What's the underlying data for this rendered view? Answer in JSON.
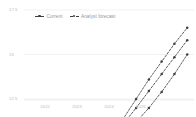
{
  "chart_data": {
    "type": "line",
    "title": "",
    "subtitle": "",
    "xlabel": "",
    "ylabel": "",
    "xlim": [
      2021.4,
      2026.6
    ],
    "ylim": [
      12.5,
      17.5
    ],
    "xticks": [
      "2022",
      "2023",
      "2024",
      "2025"
    ],
    "yticks": [
      "17.5",
      "15",
      "12.5",
      "10",
      "7.5"
    ],
    "ytick_values": [
      17.5,
      15,
      12.5,
      10,
      7.5
    ],
    "grid": true,
    "grid_axis": "y",
    "legend_position": "top-left",
    "legend": [
      "Current",
      "Analyst forecast"
    ],
    "series": [
      {
        "name": "Current",
        "style": "solid",
        "marker": "circle",
        "color": "#3c4043",
        "x": [
          2021.6,
          2022.0,
          2022.3,
          2022.6,
          2022.9,
          2023.1,
          2023.35,
          2023.6,
          2023.85,
          2024.05
        ],
        "values": [
          8.2,
          9.6,
          10.0,
          10.45,
          10.6,
          10.55,
          10.5,
          10.5,
          10.45,
          10.35
        ]
      },
      {
        "name": "Analyst forecast high",
        "style": "dashed",
        "marker": "circle",
        "color": "#3c4043",
        "x": [
          2024.05,
          2024.45,
          2024.85,
          2025.25,
          2025.65,
          2026.05,
          2026.45
        ],
        "values": [
          10.35,
          11.4,
          12.5,
          13.6,
          14.6,
          15.6,
          16.5
        ]
      },
      {
        "name": "Analyst forecast mid",
        "style": "dashed",
        "marker": "circle",
        "color": "#3c4043",
        "x": [
          2024.05,
          2024.45,
          2024.85,
          2025.25,
          2025.65,
          2026.05,
          2026.45
        ],
        "values": [
          10.3,
          11.1,
          12.0,
          12.95,
          13.9,
          14.85,
          15.8
        ]
      },
      {
        "name": "Analyst forecast low",
        "style": "dashed",
        "marker": "circle",
        "color": "#3c4043",
        "x": [
          2024.05,
          2024.45,
          2024.85,
          2025.25,
          2025.65,
          2026.05,
          2026.45
        ],
        "values": [
          10.2,
          10.6,
          11.2,
          12.0,
          12.9,
          13.9,
          15.0
        ]
      }
    ],
    "colors": {
      "line": "#3c4043",
      "grid": "#ededee",
      "tick_label": "#b6bbc0",
      "legend_label": "#8e949a",
      "background": "#ffffff"
    }
  }
}
